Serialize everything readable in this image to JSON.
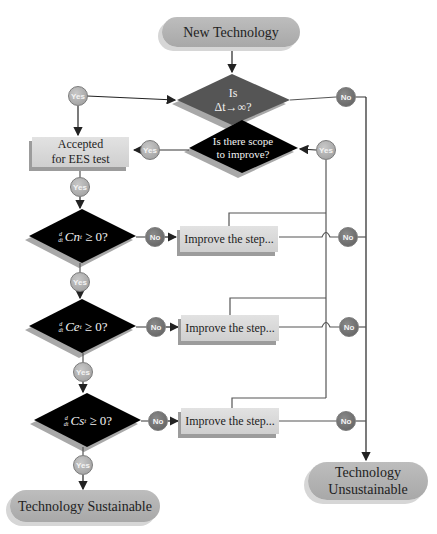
{
  "nodes": {
    "start": {
      "label": "New Technology"
    },
    "decision_time": {
      "line1": "Is",
      "line2": "Δt→∞?"
    },
    "accepted": {
      "line1": "Accepted",
      "line2": "for EES test"
    },
    "decision_scope": {
      "line1": "Is there scope",
      "line2": "to improve?"
    },
    "decision_cn": {
      "frac_num": "d",
      "frac_den": "dt",
      "expr": "Cn",
      "sub": "t",
      "rest": " ≥ 0?"
    },
    "decision_ce": {
      "frac_num": "d",
      "frac_den": "dt",
      "expr": "Ce",
      "sub": "t",
      "rest": " ≥ 0?"
    },
    "decision_cs": {
      "frac_num": "d",
      "frac_den": "dt",
      "expr": "Cs",
      "sub": "t",
      "rest": " ≥ 0?"
    },
    "improve_cn": {
      "label": "Improve the step..."
    },
    "improve_ce": {
      "label": "Improve the step..."
    },
    "improve_cs": {
      "label": "Improve the step..."
    },
    "end_sustainable": {
      "label": "Technology Sustainable"
    },
    "end_unsustainable": {
      "line1": "Technology",
      "line2": "Unsustainable"
    }
  },
  "connectors": {
    "yes": "Yes",
    "no": "No"
  },
  "colors": {
    "decision_dark_gray": "#555555",
    "decision_black": "#000000",
    "pill_gray": "#b3b3b3",
    "box_gray": "#d9d9d9",
    "line": "#555555"
  }
}
